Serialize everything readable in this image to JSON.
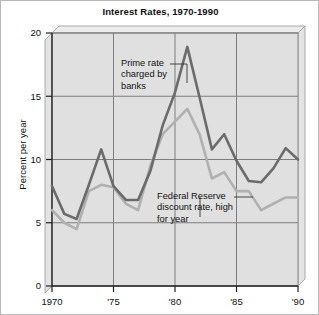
{
  "chart": {
    "title": "Interest Rates, 1970-1990",
    "ylabel": "Percent per year",
    "yticks": [
      "0",
      "5",
      "10",
      "15",
      "20"
    ],
    "xticks": [
      "1970",
      "'75",
      "'80",
      "'85",
      "'90"
    ],
    "annotation_prime": "Prime rate\ncharged by\nbanks",
    "annotation_prime_l1": "Prime rate",
    "annotation_prime_l2": "charged by",
    "annotation_prime_l3": "banks",
    "annotation_fed_l1": "Federal Reserve",
    "annotation_fed_l2": "discount rate, high",
    "annotation_fed_l3": "for year",
    "color_prime": "#6b6b6b",
    "color_fed": "#b0b0b0",
    "color_grid": "#7d7d7d",
    "color_panel": "#dcdcdc"
  },
  "chart_data": {
    "type": "line",
    "title": "Interest Rates, 1970-1990",
    "xlabel": "",
    "ylabel": "Percent per year",
    "xlim": [
      1970,
      1990
    ],
    "ylim": [
      0,
      20
    ],
    "yticks": [
      0,
      5,
      10,
      15,
      20
    ],
    "xticks": [
      1970,
      1975,
      1980,
      1985,
      1990
    ],
    "xtick_labels": [
      "1970",
      "'75",
      "'80",
      "'85",
      "'90"
    ],
    "grid": true,
    "legend": "annotations",
    "x": [
      1970,
      1971,
      1972,
      1973,
      1974,
      1975,
      1976,
      1977,
      1978,
      1979,
      1980,
      1981,
      1982,
      1983,
      1984,
      1985,
      1986,
      1987,
      1988,
      1989,
      1990
    ],
    "series": [
      {
        "name": "Prime rate charged by banks",
        "color": "#6b6b6b",
        "values": [
          7.9,
          5.7,
          5.3,
          8.0,
          10.8,
          7.9,
          6.8,
          6.8,
          9.1,
          12.7,
          15.3,
          18.9,
          14.9,
          10.8,
          12.0,
          9.9,
          8.3,
          8.2,
          9.3,
          10.9,
          10.0
        ]
      },
      {
        "name": "Federal Reserve discount rate, high for year",
        "color": "#b0b0b0",
        "values": [
          6.0,
          5.0,
          4.5,
          7.5,
          8.0,
          7.8,
          6.5,
          6.0,
          9.5,
          12.0,
          13.0,
          14.0,
          12.0,
          8.5,
          9.0,
          7.5,
          7.5,
          6.0,
          6.5,
          7.0,
          7.0
        ]
      }
    ],
    "annotations": [
      {
        "text": "Prime rate charged by banks",
        "target_series": "Prime rate charged by banks"
      },
      {
        "text": "Federal Reserve discount rate, high for year",
        "target_series": "Federal Reserve discount rate, high for year"
      }
    ]
  }
}
